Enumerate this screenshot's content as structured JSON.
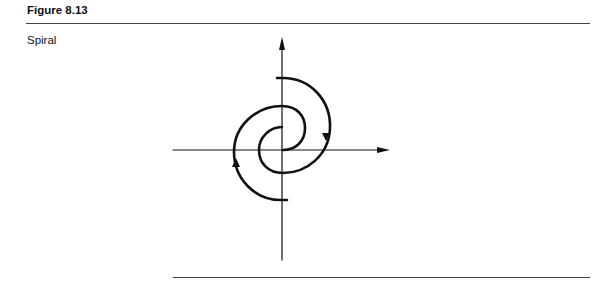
{
  "figure": {
    "label": "Figure 8.13",
    "caption": "Spiral"
  },
  "diagram": {
    "type": "phase-portrait",
    "elements": [
      "vertical-axis",
      "horizontal-axis",
      "spiral-arm-1",
      "spiral-arm-2"
    ],
    "stroke_color": "#111111"
  }
}
